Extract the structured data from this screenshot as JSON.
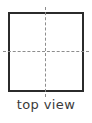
{
  "figure": {
    "name": "orthographic-top-view",
    "caption": "top view",
    "shape": {
      "type": "square",
      "stroke_color": "#2b2b2b",
      "fill_color": "#ffffff",
      "stroke_width_px": 2
    },
    "centerlines": {
      "style": "dashed",
      "color": "#8d8d8d",
      "horizontal_label": "horizontal centerline",
      "vertical_label": "vertical centerline",
      "count": 2
    },
    "background_color": "#ffffff"
  }
}
